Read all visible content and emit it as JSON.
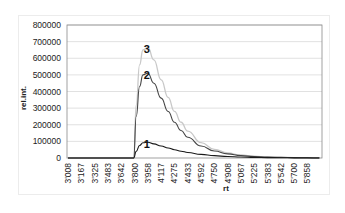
{
  "chart_data": {
    "type": "line",
    "title": "",
    "xlabel": "rt",
    "ylabel": "rel.int.",
    "ylim": [
      0,
      800000
    ],
    "yticks": [
      "0",
      "100000",
      "200000",
      "300000",
      "400000",
      "500000",
      "600000",
      "700000",
      "800000"
    ],
    "xtick_labels": [
      "3'008",
      "3'167",
      "3'325",
      "3'483",
      "3'642",
      "3'800",
      "3'958",
      "4'117",
      "4'275",
      "4'433",
      "4'592",
      "4'750",
      "4'908",
      "5'067",
      "5'225",
      "5'383",
      "5'542",
      "5'700",
      "5'858"
    ],
    "grid": "horizontal",
    "legend": "none (curves labeled inline 1, 2, 3)",
    "x": [
      3008,
      3642,
      3790,
      3820,
      3860,
      3900,
      3958,
      4030,
      4117,
      4200,
      4275,
      4354,
      4433,
      4592,
      4750,
      4908,
      5067,
      5225,
      5383,
      5542,
      5700,
      5858,
      6000,
      6200,
      6400
    ],
    "series": [
      {
        "name": "1",
        "color": "#1a1a1a",
        "values": [
          0,
          0,
          0,
          40000,
          75000,
          92000,
          95000,
          85000,
          72000,
          60000,
          50000,
          41000,
          33000,
          22000,
          14000,
          9000,
          6000,
          4000,
          2500,
          1500,
          1000,
          600,
          300,
          100,
          0
        ]
      },
      {
        "name": "2",
        "color": "#444444",
        "values": [
          0,
          0,
          0,
          250000,
          430000,
          500000,
          510000,
          450000,
          360000,
          280000,
          215000,
          165000,
          125000,
          72000,
          42000,
          25000,
          15000,
          9000,
          5500,
          3500,
          2000,
          1200,
          600,
          200,
          0
        ]
      },
      {
        "name": "3",
        "color": "#c8c8c8",
        "values": [
          0,
          0,
          0,
          320000,
          560000,
          650000,
          665000,
          590000,
          470000,
          365000,
          280000,
          215000,
          162000,
          92000,
          52000,
          30000,
          18000,
          11000,
          6500,
          4000,
          2400,
          1400,
          700,
          250,
          0
        ]
      }
    ],
    "annotations": [
      {
        "text": "1",
        "x": 3958,
        "y": 95000
      },
      {
        "text": "2",
        "x": 3958,
        "y": 510000
      },
      {
        "text": "3",
        "x": 3958,
        "y": 665000
      }
    ]
  }
}
